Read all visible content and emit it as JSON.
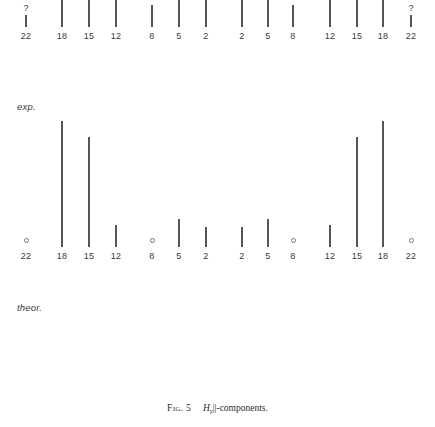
{
  "caption": {
    "figure_number": "Fig. 5",
    "symbol": "H",
    "subscript": "γ",
    "rest": "||-components."
  },
  "panels": {
    "exp": {
      "label": "exp."
    },
    "theor": {
      "label": "theor."
    }
  },
  "chart_data": {
    "type": "bar",
    "xlabel": "",
    "ylabel": "",
    "grid": false,
    "legend": "none",
    "categories": [
      "22",
      "18",
      "15",
      "12",
      "8",
      "5",
      "2",
      "2",
      "5",
      "8",
      "12",
      "15",
      "18",
      "22"
    ],
    "x_positions_px": [
      26,
      62,
      89,
      116,
      152,
      179,
      206,
      242,
      268,
      293,
      330,
      357,
      383,
      411
    ],
    "series": [
      {
        "name": "exp.",
        "values": [
          12,
          168,
          108,
          38,
          22,
          30,
          30,
          30,
          30,
          22,
          38,
          108,
          168,
          12
        ],
        "markers": [
          "?",
          "",
          "",
          "",
          "",
          "",
          "",
          "",
          "",
          "",
          "",
          "",
          "",
          "?"
        ]
      },
      {
        "name": "theor.",
        "values": [
          0,
          126,
          110,
          22,
          0,
          28,
          20,
          20,
          28,
          0,
          22,
          110,
          126,
          0
        ],
        "markers": [
          "○",
          "",
          "",
          "",
          "○",
          "",
          "",
          "",
          "",
          "○",
          "",
          "",
          "",
          "○"
        ]
      }
    ]
  }
}
